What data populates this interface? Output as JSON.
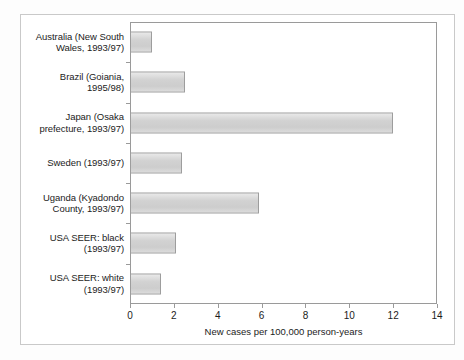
{
  "chart_data": {
    "type": "bar",
    "orientation": "horizontal",
    "title": "",
    "xlabel": "New cases per 100,000 person-years",
    "ylabel": "",
    "xlim": [
      0,
      14
    ],
    "xticks": [
      0,
      2,
      4,
      6,
      8,
      10,
      12,
      14
    ],
    "xtick_labels": [
      "0",
      "2",
      "4",
      "6",
      "8",
      "10",
      "12",
      "14"
    ],
    "grid": false,
    "legend": null,
    "categories": [
      "Australia (New South Wales, 1993/97)",
      "Brazil (Goiania, 1995/98)",
      "Japan (Osaka prefecture, 1993/97)",
      "Sweden (1993/97)",
      "Uganda (Kyadondo County, 1993/97)",
      "USA SEER: black (1993/97)",
      "USA SEER: white (1993/97)"
    ],
    "values": [
      1.0,
      2.5,
      12.0,
      2.35,
      5.9,
      2.1,
      1.4
    ],
    "bar_fill_color": "#d4d4d4",
    "bar_edge_color": "#9d9d9d",
    "axis_color": "#9a9a9a",
    "text_color": "#1c1c1c",
    "background_color": "#ffffff"
  },
  "labels": {
    "cat_0_line_1": "Australia (New South",
    "cat_0_line_2": "Wales, 1993/97)",
    "cat_1_line_1": "Brazil (Goiania,",
    "cat_1_line_2": "1995/98)",
    "cat_2_line_1": "Japan (Osaka",
    "cat_2_line_2": "prefecture, 1993/97)",
    "cat_3_line_1": "Sweden (1993/97)",
    "cat_3_line_2": "",
    "cat_4_line_1": "Uganda (Kyadondo",
    "cat_4_line_2": "County, 1993/97)",
    "cat_5_line_1": "USA SEER: black",
    "cat_5_line_2": "(1993/97)",
    "cat_6_line_1": "USA SEER: white",
    "cat_6_line_2": "(1993/97)"
  }
}
